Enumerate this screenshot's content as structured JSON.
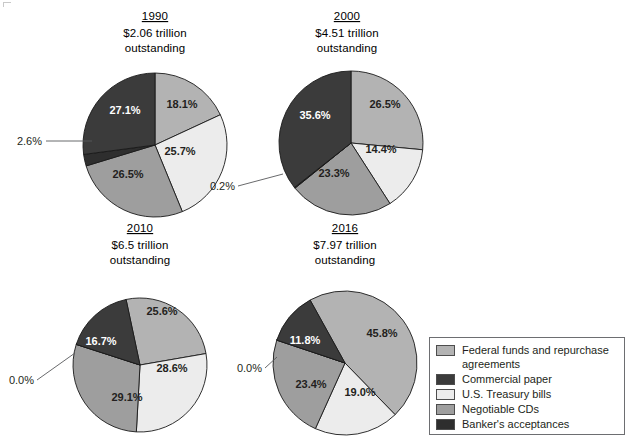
{
  "chart_data": {
    "type": "pie",
    "legend_position": "bottom-right",
    "series_names": [
      "Federal funds and repurchase agreements",
      "Commercial paper",
      "U.S. Treasury bills",
      "Negotiable CDs",
      "Banker's acceptances"
    ],
    "colors": {
      "federal_funds": "#b3b3b3",
      "commercial_paper": "#3b3b3b",
      "treasury_bills": "#ececec",
      "negotiable_cds": "#9e9e9e",
      "bankers_acceptances": "#2e2e2e"
    },
    "panels": [
      {
        "id": "panel-1990",
        "year": "1990",
        "total": "$2.06 trillion",
        "total_line2": "outstanding",
        "categories": [
          "Federal funds and repurchase agreements",
          "U.S. Treasury bills",
          "Negotiable CDs",
          "Banker's acceptances",
          "Commercial paper"
        ],
        "values": [
          18.1,
          25.7,
          26.5,
          2.6,
          27.1
        ],
        "labels": [
          "18.1%",
          "25.7%",
          "26.5%",
          "2.6%",
          "27.1%"
        ],
        "callout": "2.6%"
      },
      {
        "id": "panel-2000",
        "year": "2000",
        "total": "$4.51 trillion",
        "total_line2": "outstanding",
        "categories": [
          "Federal funds and repurchase agreements",
          "U.S. Treasury bills",
          "Negotiable CDs",
          "Banker's acceptances",
          "Commercial paper"
        ],
        "values": [
          26.5,
          14.4,
          23.3,
          0.2,
          35.6
        ],
        "labels": [
          "26.5%",
          "14.4%",
          "23.3%",
          "0.2%",
          "35.6%"
        ],
        "callout": "0.2%"
      },
      {
        "id": "panel-2010",
        "year": "2010",
        "total": "$6.5 trillion",
        "total_line2": "outstanding",
        "categories": [
          "Federal funds and repurchase agreements",
          "U.S. Treasury bills",
          "Negotiable CDs",
          "Banker's acceptances",
          "Commercial paper"
        ],
        "values": [
          25.6,
          28.6,
          29.1,
          0.0,
          16.7
        ],
        "labels": [
          "25.6%",
          "28.6%",
          "29.1%",
          "0.0%",
          "16.7%"
        ],
        "callout": "0.0%"
      },
      {
        "id": "panel-2016",
        "year": "2016",
        "total": "$7.97 trillion",
        "total_line2": "outstanding",
        "categories": [
          "Federal funds and repurchase agreements",
          "U.S. Treasury bills",
          "Negotiable CDs",
          "Banker's acceptances",
          "Commercial paper"
        ],
        "values": [
          45.8,
          19.0,
          23.4,
          0.0,
          11.8
        ],
        "labels": [
          "45.8%",
          "19.0%",
          "23.4%",
          "0.0%",
          "11.8%"
        ],
        "callout": "0.0%"
      }
    ]
  },
  "panels": {
    "p1990": {
      "year": "1990",
      "total": "$2.06 trillion",
      "total_line2": "outstanding",
      "slice_federal": "18.1%",
      "slice_treasury": "25.7%",
      "slice_cds": "26.5%",
      "slice_commercial": "27.1%",
      "callout": "2.6%"
    },
    "p2000": {
      "year": "2000",
      "total": "$4.51 trillion",
      "total_line2": "outstanding",
      "slice_federal": "26.5%",
      "slice_treasury": "14.4%",
      "slice_cds": "23.3%",
      "slice_commercial": "35.6%",
      "callout": "0.2%"
    },
    "p2010": {
      "year": "2010",
      "total": "$6.5 trillion",
      "total_line2": "outstanding",
      "slice_federal": "25.6%",
      "slice_treasury": "28.6%",
      "slice_cds": "29.1%",
      "slice_commercial": "16.7%",
      "callout": "0.0%"
    },
    "p2016": {
      "year": "2016",
      "total": "$7.97 trillion",
      "total_line2": "outstanding",
      "slice_federal": "45.8%",
      "slice_treasury": "19.0%",
      "slice_cds": "23.4%",
      "slice_commercial": "11.8%",
      "callout": "0.0%"
    }
  },
  "legend": {
    "items": [
      {
        "label": "Federal funds and repurchase\nagreements",
        "color": "#b3b3b3"
      },
      {
        "label": "Commercial paper",
        "color": "#3b3b3b"
      },
      {
        "label": "U.S. Treasury bills",
        "color": "#ececec"
      },
      {
        "label": "Negotiable CDs",
        "color": "#9e9e9e"
      },
      {
        "label": "Banker's acceptances",
        "color": "#2e2e2e"
      }
    ]
  }
}
